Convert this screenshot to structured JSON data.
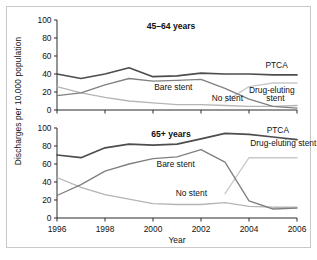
{
  "figure": {
    "ylabel": "Discharges per 10,000 population",
    "xlabel": "Year"
  },
  "colors": {
    "ptca": "#4d4d4d",
    "bare_stent": "#808080",
    "no_stent": "#b5b5b5",
    "drug_eluting": "#c9c9c9",
    "axis": "#2b2b2b",
    "frame": "#c9c9c9",
    "text": "#111111"
  },
  "panels": [
    {
      "title": "45–64 years",
      "labels": [
        {
          "text": "PTCA",
          "x": 2005.15,
          "y": 47
        },
        {
          "text": "Bare stent",
          "x": 2000.05,
          "y": 22
        },
        {
          "text": "No stent",
          "x": 2002.45,
          "y": 10
        },
        {
          "text": "Drug-eluting",
          "x": 2004.95,
          "y": 19
        },
        {
          "text": "stent",
          "x": 2005.1,
          "y": 10
        }
      ]
    },
    {
      "title": "65+ years",
      "labels": [
        {
          "text": "PTCA",
          "x": 2005.2,
          "y": 95
        },
        {
          "text": "Bare stent",
          "x": 2000.15,
          "y": 57
        },
        {
          "text": "No stent",
          "x": 2000.95,
          "y": 24
        },
        {
          "text": "Drug-eluting stent",
          "x": 2004.05,
          "y": 80
        }
      ]
    }
  ],
  "chart_data": [
    {
      "type": "line",
      "title": "45–64 years",
      "xlabel": "Year",
      "ylabel": "Discharges per 10,000 population",
      "xlim": [
        1996,
        2006
      ],
      "ylim": [
        0,
        100
      ],
      "xticks": [
        1996,
        1998,
        2000,
        2002,
        2004,
        2006
      ],
      "yticks": [
        0,
        20,
        40,
        60,
        80,
        100
      ],
      "grid": false,
      "legend": "inline-annotations",
      "x": [
        1996,
        1997,
        1998,
        1999,
        2000,
        2001,
        2002,
        2003,
        2004,
        2005,
        2006
      ],
      "series": [
        {
          "name": "PTCA",
          "color": "#4d4d4d",
          "values": [
            40,
            35,
            40,
            47,
            37,
            38,
            41,
            40,
            40,
            39,
            39
          ]
        },
        {
          "name": "Bare stent",
          "color": "#808080",
          "values": [
            16,
            19,
            28,
            35,
            32,
            33,
            34,
            24,
            12,
            4,
            2
          ]
        },
        {
          "name": "No stent",
          "color": "#b5b5b5",
          "values": [
            26,
            19,
            14,
            10,
            8,
            6,
            6,
            5,
            4,
            4,
            5
          ]
        },
        {
          "name": "Drug-eluting stent",
          "color": "#c9c9c9",
          "values": [
            0,
            0,
            0,
            0,
            0,
            0,
            0,
            9,
            26,
            30,
            30
          ]
        }
      ]
    },
    {
      "type": "line",
      "title": "65+ years",
      "xlabel": "Year",
      "ylabel": "Discharges per 10,000 population",
      "xlim": [
        1996,
        2006
      ],
      "ylim": [
        0,
        100
      ],
      "xticks": [
        1996,
        1998,
        2000,
        2002,
        2004,
        2006
      ],
      "yticks": [
        0,
        20,
        40,
        60,
        80,
        100
      ],
      "grid": false,
      "legend": "inline-annotations",
      "x": [
        1996,
        1997,
        1998,
        1999,
        2000,
        2001,
        2002,
        2003,
        2004,
        2005,
        2006
      ],
      "series": [
        {
          "name": "PTCA",
          "color": "#4d4d4d",
          "values": [
            70,
            67,
            78,
            82,
            81,
            82,
            88,
            94,
            93,
            90,
            87
          ]
        },
        {
          "name": "Bare stent",
          "color": "#808080",
          "values": [
            25,
            37,
            52,
            60,
            66,
            68,
            76,
            62,
            19,
            10,
            11
          ]
        },
        {
          "name": "No stent",
          "color": "#b5b5b5",
          "values": [
            45,
            34,
            26,
            21,
            16,
            15,
            15,
            17,
            13,
            12,
            12
          ]
        },
        {
          "name": "Drug-eluting stent",
          "color": "#c9c9c9",
          "values": [
            0,
            0,
            0,
            0,
            0,
            0,
            0,
            27,
            67,
            67,
            67
          ]
        }
      ]
    }
  ]
}
